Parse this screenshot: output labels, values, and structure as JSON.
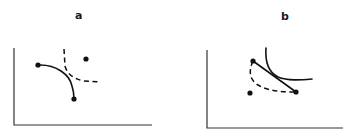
{
  "figure": {
    "panels": [
      {
        "id": "a",
        "label": "a",
        "elements": {
          "points": [
            {
              "role": "curve-endpoint",
              "x": 38,
              "y": 65
            },
            {
              "role": "curve-endpoint",
              "x": 74,
              "y": 99
            },
            {
              "role": "isolated-point",
              "x": 86,
              "y": 59
            }
          ],
          "solid_curve": "convex arc between two endpoints",
          "dashed_curve": "dashed indifference-type curve crossing the solid arc"
        }
      },
      {
        "id": "b",
        "label": "b",
        "elements": {
          "points": [
            {
              "role": "line-endpoint",
              "x": 253,
              "y": 61
            },
            {
              "role": "line-endpoint",
              "x": 296,
              "y": 92
            },
            {
              "role": "isolated-point",
              "x": 250,
              "y": 93
            }
          ],
          "straight_line": "segment joining the two endpoints",
          "solid_curve": "convex curve tangent to the segment",
          "dashed_curve": "dashed arc below the segment between endpoints"
        }
      }
    ],
    "colors": {
      "ink": "#111111",
      "axis": "#333333",
      "background": "#ffffff"
    }
  }
}
